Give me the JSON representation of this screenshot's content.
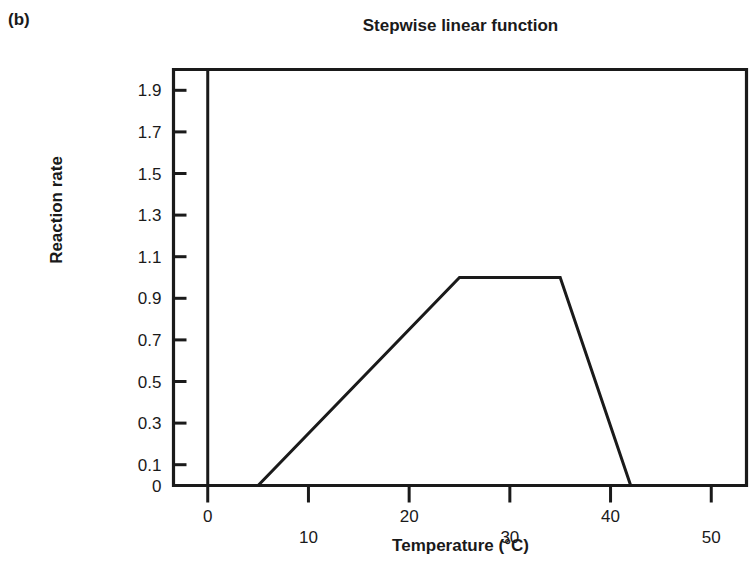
{
  "figure": {
    "panel_label": "(b)",
    "title": "Stepwise linear function"
  },
  "chart_data": {
    "type": "line",
    "title": "Stepwise linear function",
    "xlabel": "Temperature (°C)",
    "ylabel": "Reaction rate",
    "xlim": [
      -3.4,
      53.5
    ],
    "ylim": [
      0,
      2.0
    ],
    "grid": false,
    "legend": null,
    "xticks": [
      0,
      10,
      20,
      30,
      40,
      50
    ],
    "xticklabels": [
      "0",
      "10",
      "20",
      "30",
      "40",
      "50"
    ],
    "yticks": [
      0,
      0.1,
      0.3,
      0.5,
      0.7,
      0.9,
      1.1,
      1.3,
      1.5,
      1.7,
      1.9
    ],
    "yticklabels": [
      "0",
      "0.1",
      "0.3",
      "0.5",
      "0.7",
      "0.9",
      "1.1",
      "1.3",
      "1.5",
      "1.7",
      "1.9"
    ],
    "series": [
      {
        "name": "Stepwise linear reaction rate",
        "x": [
          -3.4,
          5,
          25,
          35,
          42,
          53.5
        ],
        "values": [
          0,
          0,
          1.0,
          1.0,
          0,
          0
        ]
      }
    ],
    "breakpoints": [
      {
        "temperature": 5,
        "rate": 0
      },
      {
        "temperature": 25,
        "rate": 1.0
      },
      {
        "temperature": 35,
        "rate": 1.0
      },
      {
        "temperature": 42,
        "rate": 0
      }
    ],
    "line_color": "#1a1a1a",
    "axis_color": "#1a1a1a"
  }
}
